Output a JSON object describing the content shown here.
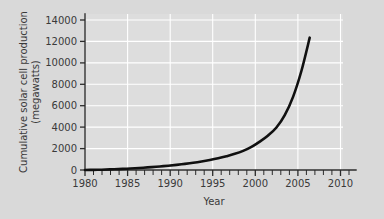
{
  "chart_data": {
    "type": "line",
    "title": "",
    "xlabel": "Year",
    "ylabel": "Cumulative solar cell production (megawatts)",
    "ylabel_line1": "Cumulative solar cell production",
    "ylabel_line2": "(megawatts)",
    "xlim": [
      1980,
      2011
    ],
    "ylim": [
      0,
      14500
    ],
    "grid": true,
    "legend": null,
    "x_ticks": [
      1980,
      1985,
      1990,
      1995,
      2000,
      2005,
      2010
    ],
    "x_tick_labels": [
      "1980",
      "1985",
      "1990",
      "1995",
      "2000",
      "2005",
      "2010"
    ],
    "x_minor_tick_step": 1,
    "y_ticks": [
      0,
      2000,
      4000,
      6000,
      8000,
      10000,
      12000,
      14000
    ],
    "y_tick_labels": [
      "0",
      "2000",
      "4000",
      "6000",
      "8000",
      "10000",
      "12000",
      "14000"
    ],
    "series": [
      {
        "name": "Cumulative solar cell production",
        "color": "#101010",
        "x": [
          1980,
          1981,
          1982,
          1983,
          1984,
          1985,
          1986,
          1987,
          1988,
          1989,
          1990,
          1991,
          1992,
          1993,
          1994,
          1995,
          1996,
          1997,
          1998,
          1999,
          2000,
          2001,
          2002,
          2003,
          2004,
          2005,
          2006,
          2007
        ],
        "values": [
          5,
          15,
          30,
          55,
          85,
          120,
          165,
          215,
          270,
          330,
          400,
          480,
          570,
          670,
          790,
          930,
          1090,
          1280,
          1500,
          1780,
          2150,
          2640,
          3210,
          3950,
          5100,
          6800,
          9200,
          12300
        ]
      }
    ]
  },
  "colors": {
    "page_background": "#d9d9d9",
    "plot_background": "#dddddd",
    "gridline": "#ffffff",
    "axis": "#2b2b2b",
    "curve": "#101010",
    "text": "#3a3a3a"
  }
}
